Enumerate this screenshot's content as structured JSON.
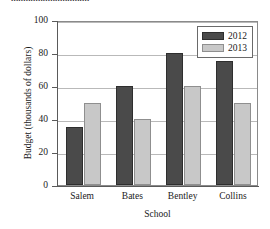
{
  "title_remnant": "................................",
  "chart_data": {
    "type": "bar",
    "title": "",
    "xlabel": "School",
    "ylabel": "Budget (thousands of dollars)",
    "categories": [
      "Salem",
      "Bates",
      "Bentley",
      "Collins"
    ],
    "series": [
      {
        "name": "2012",
        "color": "#4a4a4a",
        "values": [
          35,
          60,
          80,
          75
        ]
      },
      {
        "name": "2013",
        "color": "#c8c8c8",
        "values": [
          50,
          40,
          60,
          50
        ]
      }
    ],
    "ylim": [
      0,
      100
    ],
    "yticks": [
      0,
      20,
      40,
      60,
      80,
      100
    ],
    "ytick_labels": [
      "0",
      "20",
      "40",
      "60",
      "80",
      "100"
    ],
    "grid": true,
    "legend_position": "top-right-inside"
  },
  "legend": {
    "entries": [
      {
        "label": "2012"
      },
      {
        "label": "2013"
      }
    ]
  }
}
